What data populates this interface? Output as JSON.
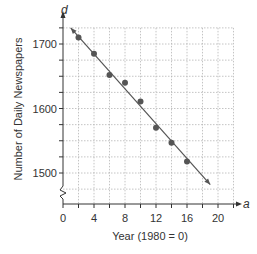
{
  "chart_data": {
    "type": "scatter",
    "title": "",
    "xlabel": "Year (1980 = 0)",
    "ylabel": "Number of Daily Newspapers",
    "x_axis_var": "a",
    "y_axis_var": "d",
    "x_ticks": [
      0,
      4,
      8,
      12,
      16,
      20
    ],
    "y_ticks": [
      1500,
      1600,
      1700
    ],
    "xlim": [
      0,
      22
    ],
    "ylim": [
      1475,
      1725
    ],
    "grid": true,
    "axis_break_on_y": true,
    "series": [
      {
        "name": "Daily newspapers",
        "x": [
          2,
          4,
          6,
          8,
          10,
          12,
          14,
          16
        ],
        "y": [
          1710,
          1685,
          1652,
          1640,
          1611,
          1570,
          1547,
          1518
        ]
      }
    ],
    "trend_line": {
      "type": "linear",
      "start": [
        1,
        1725
      ],
      "end": [
        19,
        1482
      ],
      "arrow_end": true
    },
    "colors": {
      "point": "#555555",
      "line": "#555555",
      "grid": "#b5b5b5",
      "axis": "#333333"
    }
  }
}
